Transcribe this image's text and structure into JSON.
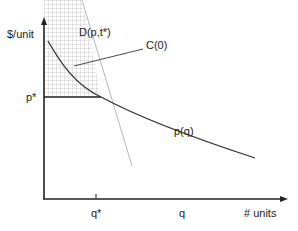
{
  "diagram": {
    "y_axis_label": "$/unit",
    "x_axis_label": "# units",
    "demand_label": "D(p,t*)",
    "cost_label": "C(0)",
    "price_curve_label": "p(q)",
    "price_star_label": "p*",
    "q_star_label": "q*",
    "q_label": "q"
  }
}
